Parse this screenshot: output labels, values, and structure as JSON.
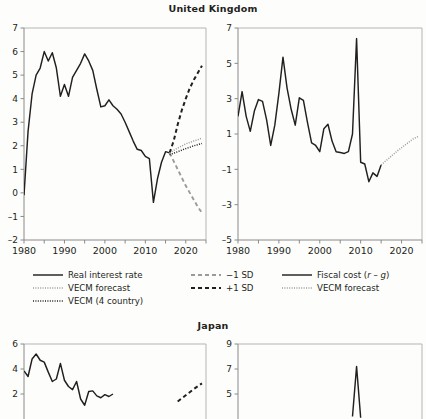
{
  "figure": {
    "panels": [
      {
        "id": "uk",
        "title": "United Kingdom"
      },
      {
        "id": "jp",
        "title": "Japan"
      }
    ]
  },
  "legend": {
    "columns": [
      {
        "items": [
          {
            "label": "Real interest rate",
            "style": "solid-black",
            "icon": "solid-line-icon"
          },
          {
            "label": "VECM forecast",
            "style": "dotted-gray",
            "icon": "dotted-line-icon"
          },
          {
            "label": "VECM (4 country)",
            "style": "dotted-black",
            "icon": "dotted-line-icon"
          }
        ]
      },
      {
        "items": [
          {
            "label": "−1 SD",
            "style": "dashed-gray",
            "icon": "dashed-line-icon"
          },
          {
            "label": "+1 SD",
            "style": "dashed-black",
            "icon": "dashed-line-icon"
          }
        ]
      },
      {
        "items": [
          {
            "label_parts": {
              "pre": "Fiscal cost (",
              "italic1": "r",
              "mid": " – ",
              "italic2": "g",
              "post": ")"
            },
            "label": "Fiscal cost (r – g)",
            "style": "solid-black",
            "icon": "solid-line-icon"
          },
          {
            "label": "VECM forecast",
            "style": "dotted-gray",
            "icon": "dotted-line-icon"
          }
        ]
      }
    ]
  },
  "colors": {
    "line": "#231f20",
    "gray": "#9b9b9b",
    "axis": "#8a8a8a",
    "frame": "#b5b5b5",
    "text": "#231f20"
  },
  "chart_data": [
    {
      "id": "uk-real-interest-rate",
      "type": "line",
      "title": "United Kingdom",
      "subplot": "left",
      "xlabel": "",
      "ylabel": "",
      "xlim": [
        1980,
        2025
      ],
      "ylim": [
        -2,
        7
      ],
      "yticks": [
        -2,
        -1,
        0,
        1,
        2,
        3,
        4,
        5,
        6,
        7
      ],
      "xticks": [
        1980,
        1985,
        1990,
        1995,
        2000,
        2005,
        2010,
        2015,
        2020,
        2025
      ],
      "xticklabels": [
        "1980",
        "",
        "1990",
        "",
        "2000",
        "",
        "2010",
        "",
        "2020",
        ""
      ],
      "grid": false,
      "legend_position": "below-figure",
      "series": [
        {
          "name": "Real interest rate",
          "style": "solid-black",
          "x": [
            1980,
            1981,
            1982,
            1983,
            1984,
            1985,
            1986,
            1987,
            1988,
            1989,
            1990,
            1991,
            1992,
            1993,
            1994,
            1995,
            1996,
            1997,
            1998,
            1999,
            2000,
            2001,
            2002,
            2003,
            2004,
            2005,
            2006,
            2007,
            2008,
            2009,
            2010,
            2011,
            2012,
            2013,
            2014,
            2015,
            2016
          ],
          "values": [
            -0.1,
            2.6,
            4.2,
            5.0,
            5.3,
            6.0,
            5.6,
            5.95,
            5.3,
            4.1,
            4.6,
            4.1,
            4.9,
            5.2,
            5.5,
            5.9,
            5.6,
            5.2,
            4.4,
            3.65,
            3.7,
            3.95,
            3.7,
            3.55,
            3.35,
            3.0,
            2.6,
            2.2,
            1.85,
            1.8,
            1.55,
            1.45,
            -0.4,
            0.6,
            1.3,
            1.75,
            1.7
          ]
        },
        {
          "name": "+1 SD",
          "style": "dashed-black",
          "x": [
            2016,
            2017,
            2018,
            2019,
            2020,
            2021,
            2022,
            2023,
            2024
          ],
          "values": [
            1.7,
            2.2,
            2.9,
            3.5,
            4.0,
            4.45,
            4.8,
            5.1,
            5.4
          ]
        },
        {
          "name": "−1 SD",
          "style": "dashed-gray",
          "x": [
            2016,
            2017,
            2018,
            2019,
            2020,
            2021,
            2022,
            2023,
            2024
          ],
          "values": [
            1.7,
            1.35,
            1.0,
            0.65,
            0.3,
            0.0,
            -0.3,
            -0.6,
            -0.85
          ]
        },
        {
          "name": "VECM forecast",
          "style": "dotted-gray",
          "x": [
            2016,
            2018,
            2020,
            2022,
            2024
          ],
          "values": [
            1.7,
            1.9,
            2.08,
            2.2,
            2.32
          ]
        },
        {
          "name": "VECM (4 country)",
          "style": "dotted-black",
          "x": [
            2016,
            2018,
            2020,
            2022,
            2024
          ],
          "values": [
            1.62,
            1.75,
            1.88,
            2.0,
            2.1
          ]
        }
      ]
    },
    {
      "id": "uk-fiscal-cost",
      "type": "line",
      "title": "United Kingdom",
      "subplot": "right",
      "xlabel": "",
      "ylabel": "",
      "xlim": [
        1980,
        2025
      ],
      "ylim": [
        -5,
        7
      ],
      "yticks": [
        -5,
        -3,
        -1,
        1,
        3,
        5,
        7
      ],
      "xticks": [
        1980,
        1985,
        1990,
        1995,
        2000,
        2005,
        2010,
        2015,
        2020,
        2025
      ],
      "xticklabels": [
        "1980",
        "",
        "1990",
        "",
        "2000",
        "",
        "2010",
        "",
        "2020",
        ""
      ],
      "grid": false,
      "series": [
        {
          "name": "Fiscal cost (r – g)",
          "style": "solid-black",
          "x": [
            1980,
            1981,
            1982,
            1983,
            1984,
            1985,
            1986,
            1987,
            1988,
            1989,
            1990,
            1991,
            1992,
            1993,
            1994,
            1995,
            1996,
            1997,
            1998,
            1999,
            2000,
            2001,
            2002,
            2003,
            2004,
            2005,
            2006,
            2007,
            2008,
            2009,
            2010,
            2011,
            2012,
            2013,
            2014,
            2015
          ],
          "values": [
            2.0,
            3.4,
            2.0,
            1.15,
            2.3,
            2.95,
            2.85,
            1.8,
            0.35,
            1.5,
            3.3,
            5.35,
            3.6,
            2.4,
            1.5,
            3.05,
            2.9,
            1.65,
            0.5,
            0.35,
            0.0,
            1.3,
            1.55,
            0.6,
            0.0,
            -0.05,
            -0.1,
            0.0,
            1.0,
            6.4,
            -0.6,
            -0.7,
            -1.7,
            -1.2,
            -1.4,
            -0.75
          ]
        },
        {
          "name": "VECM forecast",
          "style": "dotted-gray",
          "x": [
            2015,
            2017,
            2019,
            2021,
            2023,
            2024
          ],
          "values": [
            -0.75,
            -0.35,
            0.05,
            0.4,
            0.75,
            0.85
          ]
        }
      ]
    },
    {
      "id": "jp-real-interest-rate",
      "type": "line",
      "title": "Japan",
      "subplot": "left",
      "note": "panel cropped by image bottom edge",
      "xlim": [
        1980,
        2025
      ],
      "ylim": [
        0,
        6
      ],
      "yticks": [
        2,
        4,
        6
      ],
      "grid": false,
      "series": [
        {
          "name": "Real interest rate",
          "style": "solid-black",
          "x": [
            1980,
            1981,
            1982,
            1983,
            1984,
            1985,
            1986,
            1987,
            1988,
            1989,
            1990,
            1991,
            1992,
            1993,
            1994,
            1995,
            1996,
            1997,
            1998,
            1999,
            2000,
            2001,
            2002
          ],
          "values": [
            3.85,
            3.4,
            4.8,
            5.2,
            4.7,
            4.55,
            3.75,
            3.0,
            3.2,
            4.45,
            3.1,
            2.6,
            2.35,
            3.0,
            1.6,
            1.1,
            2.2,
            2.25,
            1.85,
            1.7,
            1.95,
            1.8,
            2.0
          ]
        },
        {
          "name": "+1 SD",
          "style": "dashed-black",
          "x": [
            2018,
            2020,
            2022,
            2024
          ],
          "values": [
            1.4,
            1.9,
            2.4,
            2.85
          ]
        }
      ]
    },
    {
      "id": "jp-fiscal-cost",
      "type": "line",
      "title": "Japan",
      "subplot": "right",
      "note": "panel cropped by image bottom edge",
      "xlim": [
        1980,
        2025
      ],
      "ylim": [
        3,
        9
      ],
      "yticks": [
        5,
        7,
        9
      ],
      "grid": false,
      "series": [
        {
          "name": "Fiscal cost (r – g)",
          "style": "solid-black",
          "x": [
            2008,
            2009,
            2010
          ],
          "values": [
            3.2,
            7.2,
            3.1
          ]
        }
      ]
    }
  ]
}
